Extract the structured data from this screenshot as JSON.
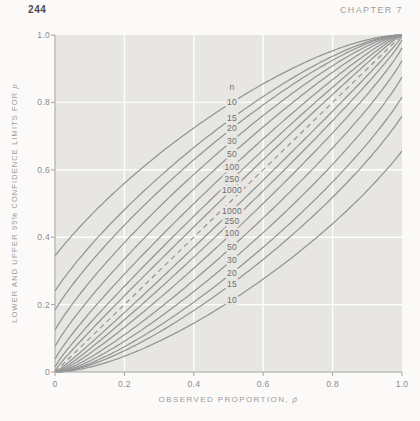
{
  "page": {
    "number": "244",
    "chapter_header": "CHAPTER 7"
  },
  "chart_data": {
    "type": "line",
    "title": "",
    "xlabel_prefix": "OBSERVED PROPORTION, ",
    "xlabel_symbol": "p̄",
    "ylabel_prefix": "LOWER AND UPPER 95% CONFIDENCE LIMITS FOR ",
    "ylabel_symbol": "p",
    "xlim": [
      0,
      1
    ],
    "ylim": [
      0,
      1
    ],
    "xticks": [
      0,
      0.2,
      0.4,
      0.6,
      0.8,
      1.0
    ],
    "yticks": [
      0,
      0.2,
      0.4,
      0.6,
      0.8,
      1.0
    ],
    "xtick_labels": [
      "0",
      "0.2",
      "0.4",
      "0.6",
      "0.8",
      "1.0"
    ],
    "ytick_labels": [
      "0",
      "0.2",
      "0.4",
      "0.6",
      "0.8",
      "1.0"
    ],
    "grid": true,
    "confidence_level": "95%",
    "z_value": 1.96,
    "sample_sizes": [
      10,
      15,
      20,
      30,
      50,
      100,
      250,
      1000
    ],
    "curve_label_header": "n",
    "curve_labels_upper_top_to_bottom": [
      "10",
      "15",
      "20",
      "30",
      "50",
      "100",
      "250",
      "1000"
    ],
    "curve_labels_lower_top_to_bottom": [
      "1000",
      "250",
      "100",
      "50",
      "30",
      "20",
      "15",
      "10"
    ],
    "label_column_x": 0.51,
    "upper_belt_y_at_label_column": {
      "10": 0.83,
      "15": 0.77,
      "20": 0.73,
      "30": 0.69,
      "50": 0.65,
      "100": 0.6,
      "250": 0.56,
      "1000": 0.52
    },
    "lower_belt_y_at_label_column": {
      "1000": 0.46,
      "250": 0.43,
      "100": 0.4,
      "50": 0.35,
      "30": 0.3,
      "20": 0.26,
      "15": 0.22,
      "10": 0.18
    },
    "diagonal": {
      "style": "dashed",
      "from": [
        0,
        0
      ],
      "to": [
        1,
        1
      ]
    },
    "legend_position": "none",
    "colors": {
      "page_bg": "#fbfaf8",
      "panel": "#e7e6e3",
      "grid": "#fdfdfc",
      "curve": "#949494",
      "axis": "#a3a3a3",
      "tick_text": "#8c8c8c",
      "axis_title_text": "#9b9b9b",
      "curve_label_text": "#6e6e6e",
      "page_number_text": "#4c4c4c",
      "chapter_text": "#9e9e9e"
    }
  }
}
